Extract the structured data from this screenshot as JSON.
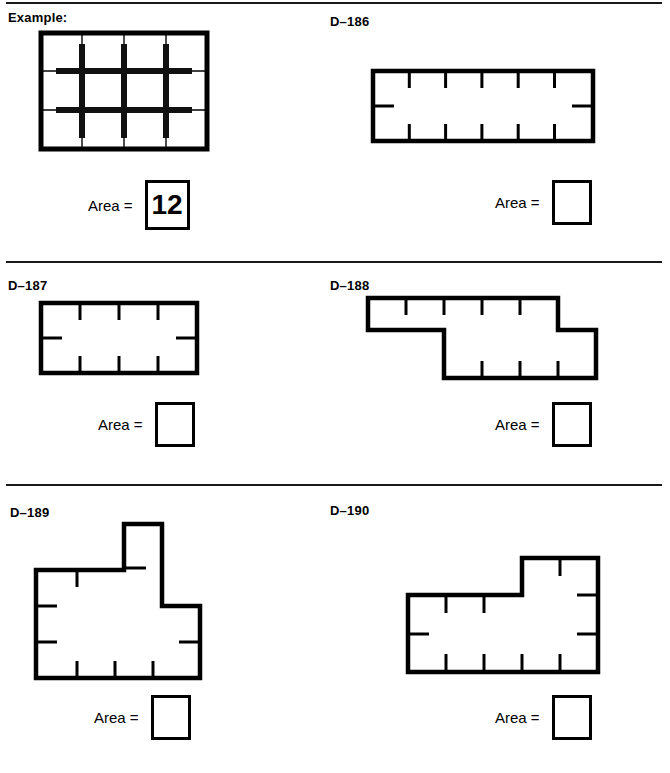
{
  "worksheet": {
    "example_label": "Example:",
    "area_label": "Area ="
  },
  "panels": [
    {
      "id": "example",
      "label": "Example:",
      "area_label": "Area =",
      "answer": "12",
      "answered": true,
      "shape": "rectangle",
      "cols": 4,
      "rows": 3,
      "area_value": 12,
      "gridlines_drawn": true
    },
    {
      "id": "d186",
      "label": "D–186",
      "area_label": "Area =",
      "answer": "",
      "answered": false,
      "shape": "rectangle",
      "cols": 6,
      "rows": 2,
      "area_value": 12,
      "gridlines_drawn": false
    },
    {
      "id": "d187",
      "label": "D–187",
      "area_label": "Area =",
      "answer": "",
      "answered": false,
      "shape": "rectangle",
      "cols": 4,
      "rows": 2,
      "area_value": 8,
      "gridlines_drawn": false
    },
    {
      "id": "d188",
      "label": "D–188",
      "area_label": "Area =",
      "answer": "",
      "answered": false,
      "shape": "z-polygon",
      "area_value": 9,
      "gridlines_drawn": false
    },
    {
      "id": "d189",
      "label": "D–189",
      "area_label": "Area =",
      "answer": "",
      "answered": false,
      "shape": "cross-polygon",
      "area_value": 13,
      "gridlines_drawn": false
    },
    {
      "id": "d190",
      "label": "D–190",
      "area_label": "Area =",
      "answer": "",
      "answered": false,
      "shape": "l-polygon",
      "area_value": 13,
      "gridlines_drawn": false
    }
  ],
  "colors": {
    "ink": "#000000",
    "rule": "#1a1a1a",
    "paper": "#ffffff"
  }
}
